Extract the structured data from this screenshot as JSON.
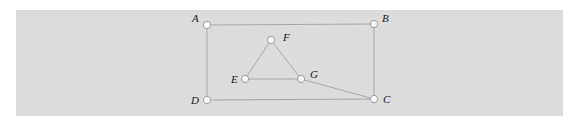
{
  "figure": {
    "type": "graph",
    "background_color": "#dcdcdc",
    "edge_color": "#a8a8a8",
    "node_fill": "#ffffff"
  },
  "nodes": [
    {
      "id": "A",
      "label": "A",
      "x": 207,
      "y": 25,
      "label_x": 192,
      "label_y": 22
    },
    {
      "id": "B",
      "label": "B",
      "x": 374,
      "y": 24,
      "label_x": 382,
      "label_y": 22
    },
    {
      "id": "C",
      "label": "C",
      "x": 374,
      "y": 99,
      "label_x": 383,
      "label_y": 103
    },
    {
      "id": "D",
      "label": "D",
      "x": 207,
      "y": 100,
      "label_x": 191,
      "label_y": 104
    },
    {
      "id": "E",
      "label": "E",
      "x": 245,
      "y": 79,
      "label_x": 231,
      "label_y": 83
    },
    {
      "id": "F",
      "label": "F",
      "x": 271,
      "y": 40,
      "label_x": 283,
      "label_y": 41
    },
    {
      "id": "G",
      "label": "G",
      "x": 301,
      "y": 79,
      "label_x": 310,
      "label_y": 78
    }
  ],
  "edges": [
    {
      "from": "A",
      "to": "B"
    },
    {
      "from": "B",
      "to": "C"
    },
    {
      "from": "C",
      "to": "D"
    },
    {
      "from": "D",
      "to": "A"
    },
    {
      "from": "E",
      "to": "F"
    },
    {
      "from": "F",
      "to": "G"
    },
    {
      "from": "E",
      "to": "G"
    },
    {
      "from": "G",
      "to": "C"
    }
  ]
}
